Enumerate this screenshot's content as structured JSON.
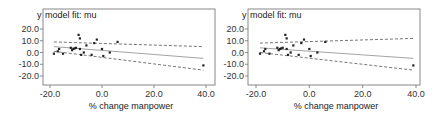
{
  "chart_data": [
    {
      "type": "scatter",
      "title": "model fit: mu",
      "ylabel": "y",
      "xlabel": "% change manpower",
      "xlim": [
        -22,
        42
      ],
      "ylim": [
        -25,
        27
      ],
      "xticks": [
        "-20.0",
        "0.0",
        "20.0",
        "40.0"
      ],
      "yticks": [
        "20.0",
        "10.0",
        "0.0",
        "-10.0",
        "-20.0"
      ],
      "grid": false,
      "points": [
        [
          -18.5,
          -1
        ],
        [
          -17,
          1
        ],
        [
          -16.5,
          3
        ],
        [
          -15,
          -1
        ],
        [
          -12,
          4
        ],
        [
          -11.5,
          2
        ],
        [
          -11,
          3
        ],
        [
          -10.5,
          3.5
        ],
        [
          -10,
          4
        ],
        [
          -9,
          15
        ],
        [
          -8.5,
          12
        ],
        [
          -8.5,
          3
        ],
        [
          -8,
          -2
        ],
        [
          -7,
          0
        ],
        [
          -6,
          6
        ],
        [
          -4,
          -2
        ],
        [
          -3,
          8
        ],
        [
          -2,
          11
        ],
        [
          0,
          3
        ],
        [
          0.5,
          -3
        ],
        [
          3,
          0
        ],
        [
          6,
          9
        ],
        [
          39,
          -11
        ]
      ],
      "fit_line": {
        "x": [
          -18.5,
          39
        ],
        "y": [
          5,
          -5
        ]
      },
      "upper_band": {
        "x": [
          -18.5,
          39
        ],
        "y": [
          9,
          5
        ]
      },
      "lower_band": {
        "x": [
          -18.5,
          39
        ],
        "y": [
          1,
          -15
        ]
      }
    },
    {
      "type": "scatter",
      "title": "model fit: mu",
      "ylabel": "y",
      "xlabel": "% change manpower",
      "xlim": [
        -22,
        42
      ],
      "ylim": [
        -25,
        27
      ],
      "xticks": [
        "-20.0",
        "0.0",
        "20.0",
        "40.0"
      ],
      "yticks": [
        "20.0",
        "10.0",
        "0.0",
        "-10.0",
        "-20.0"
      ],
      "grid": false,
      "points": [
        [
          -18.5,
          -1
        ],
        [
          -17,
          1
        ],
        [
          -16.5,
          3
        ],
        [
          -15,
          -1
        ],
        [
          -12,
          4
        ],
        [
          -11.5,
          2
        ],
        [
          -11,
          3
        ],
        [
          -10.5,
          3.5
        ],
        [
          -10,
          4
        ],
        [
          -9,
          15
        ],
        [
          -8.5,
          12
        ],
        [
          -8.5,
          3
        ],
        [
          -8,
          -2
        ],
        [
          -7,
          0
        ],
        [
          -6,
          6
        ],
        [
          -4,
          -2
        ],
        [
          -3,
          8
        ],
        [
          -2,
          11
        ],
        [
          0,
          3
        ],
        [
          0.5,
          -3
        ],
        [
          3,
          0
        ],
        [
          6,
          9
        ],
        [
          39,
          -11
        ]
      ],
      "fit_line": {
        "x": [
          -18.5,
          39
        ],
        "y": [
          4,
          -5
        ]
      },
      "upper_band": {
        "x": [
          -18.5,
          39
        ],
        "y": [
          8,
          12
        ]
      },
      "lower_band": {
        "x": [
          -18.5,
          39
        ],
        "y": [
          0,
          -15
        ]
      }
    }
  ]
}
